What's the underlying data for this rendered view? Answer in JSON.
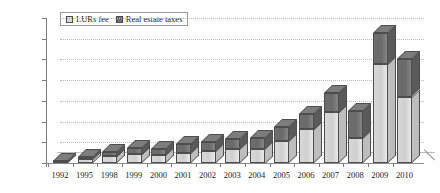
{
  "chart_data": {
    "type": "bar",
    "subtype": "stacked-3d-column",
    "title": "",
    "xlabel": "",
    "ylabel": "",
    "ylim": [
      0,
      70000
    ],
    "ytick_step": 10000,
    "ytick_labels": [
      "70 000",
      "60 000",
      "50 000",
      "40 000",
      "30 000",
      "20 000",
      "10 000",
      "0"
    ],
    "ytick_values": [
      70000,
      60000,
      50000,
      40000,
      30000,
      20000,
      10000,
      0
    ],
    "grid": true,
    "grid_style": "dotted-horizontal",
    "legend_position": "top-left-inside",
    "categories": [
      "1992",
      "1995",
      "1998",
      "1999",
      "2000",
      "2001",
      "2002",
      "2003",
      "2004",
      "2005",
      "2006",
      "2007",
      "2008",
      "2009",
      "2010"
    ],
    "series": [
      {
        "name": "LURs fee",
        "color": "#d8d8d8",
        "values": [
          500,
          1700,
          3200,
          4200,
          3700,
          4800,
          5600,
          6600,
          7000,
          10400,
          16200,
          24500,
          12300,
          48000,
          32000
        ]
      },
      {
        "name": "Real estate taxes",
        "color": "#6e6e6e",
        "values": [
          700,
          1100,
          2200,
          3200,
          3100,
          4200,
          4500,
          4900,
          5300,
          6800,
          7500,
          9500,
          12800,
          15000,
          18000
        ]
      }
    ],
    "totals": [
      1200,
      2800,
      5400,
      7400,
      6800,
      9000,
      10100,
      11500,
      12300,
      17200,
      23700,
      34000,
      25100,
      63000,
      50000
    ]
  },
  "legend": {
    "items": [
      {
        "label": "LURs fee"
      },
      {
        "label": "Real estate taxes"
      }
    ]
  },
  "colors": {
    "lurs_fee": "#d8d8d8",
    "real_estate_taxes": "#6e6e6e",
    "axis": "#7a7a7a",
    "grid": "#b9b9b9",
    "background": "#ffffff"
  }
}
